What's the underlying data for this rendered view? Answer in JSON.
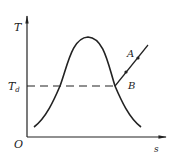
{
  "diagram": {
    "type": "T-s diagram",
    "axes": {
      "y_label": "T",
      "x_label": "s",
      "origin_label": "O"
    },
    "reference_line": {
      "label": "T",
      "subscript": "d",
      "style": "dashed"
    },
    "curve": {
      "name": "saturation dome"
    },
    "process_line": {
      "points": [
        {
          "label": "A"
        },
        {
          "label": "B"
        }
      ]
    },
    "colors": {
      "stroke": "#222222",
      "background": "#ffffff"
    }
  }
}
